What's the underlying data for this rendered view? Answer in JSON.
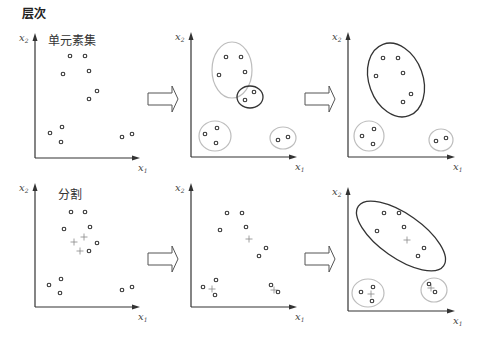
{
  "title": "层次",
  "colors": {
    "axis": "#333333",
    "point": "#333333",
    "ellipse_light": "#bdbdbd",
    "ellipse_dark": "#333333",
    "plus": "#888888",
    "arrow": "#555555"
  },
  "rows": [
    {
      "label": "单元素集",
      "panels": [
        {
          "origin": [
            35,
            158
          ],
          "ytop": 33,
          "xright": 140,
          "points": [
            [
              70,
              56
            ],
            [
              85,
              56
            ],
            [
              63,
              74
            ],
            [
              89,
              71
            ],
            [
              97,
              91
            ],
            [
              89,
              99
            ],
            [
              62,
              127
            ],
            [
              50,
              133
            ],
            [
              61,
              142
            ],
            [
              122,
              137
            ],
            [
              132,
              134
            ]
          ],
          "plus": [],
          "ellipses": []
        },
        {
          "origin": [
            191,
            157
          ],
          "ytop": 32,
          "xright": 297,
          "points": [
            [
              226,
              57
            ],
            [
              241,
              57
            ],
            [
              219,
              75
            ],
            [
              245,
              72
            ],
            [
              254,
              92
            ],
            [
              245,
              100
            ],
            [
              217,
              128
            ],
            [
              205,
              134
            ],
            [
              216,
              143
            ],
            [
              278,
              140
            ],
            [
              288,
              137
            ]
          ],
          "plus": [],
          "ellipses": [
            {
              "cx": 232,
              "cy": 70,
              "rx": 20,
              "ry": 28,
              "rot": 0,
              "tone": "light"
            },
            {
              "cx": 250,
              "cy": 97,
              "rx": 13,
              "ry": 11,
              "rot": 0,
              "tone": "dark"
            },
            {
              "cx": 215,
              "cy": 136,
              "rx": 16,
              "ry": 15,
              "rot": 0,
              "tone": "light"
            },
            {
              "cx": 283,
              "cy": 138,
              "rx": 13,
              "ry": 11,
              "rot": 0,
              "tone": "light"
            }
          ]
        },
        {
          "origin": [
            348,
            157
          ],
          "ytop": 32,
          "xright": 455,
          "points": [
            [
              383,
              58
            ],
            [
              398,
              58
            ],
            [
              376,
              76
            ],
            [
              403,
              73
            ],
            [
              411,
              94
            ],
            [
              403,
              102
            ],
            [
              374,
              129
            ],
            [
              362,
              136
            ],
            [
              373,
              144
            ],
            [
              436,
              141
            ],
            [
              446,
              138
            ]
          ],
          "plus": [],
          "ellipses": [
            {
              "cx": 396,
              "cy": 80,
              "rx": 27,
              "ry": 38,
              "rot": -20,
              "tone": "dark"
            },
            {
              "cx": 369,
              "cy": 136,
              "rx": 15,
              "ry": 15,
              "rot": 0,
              "tone": "light"
            },
            {
              "cx": 441,
              "cy": 140,
              "rx": 12,
              "ry": 11,
              "rot": 0,
              "tone": "light"
            }
          ]
        }
      ]
    },
    {
      "label": "分割",
      "panels": [
        {
          "origin": [
            35,
            307
          ],
          "ytop": 183,
          "xright": 140,
          "points": [
            [
              71,
              212
            ],
            [
              85,
              212
            ],
            [
              64,
              229
            ],
            [
              90,
              227
            ],
            [
              97,
              243
            ],
            [
              89,
              251
            ],
            [
              61,
              279
            ],
            [
              49,
              285
            ],
            [
              60,
              293
            ],
            [
              122,
              290
            ],
            [
              132,
              287
            ]
          ],
          "plus": [
            [
              84,
              237
            ],
            [
              74,
              242
            ],
            [
              80,
              251
            ]
          ],
          "ellipses": []
        },
        {
          "origin": [
            191,
            307
          ],
          "ytop": 183,
          "xright": 297,
          "points": [
            [
              227,
              213
            ],
            [
              242,
              213
            ],
            [
              220,
              230
            ],
            [
              246,
              227
            ],
            [
              266,
              248
            ],
            [
              259,
              256
            ],
            [
              216,
              280
            ],
            [
              203,
              287
            ],
            [
              215,
              295
            ],
            [
              271,
              285
            ],
            [
              278,
              292
            ]
          ],
          "plus": [
            [
              249,
              239
            ],
            [
              212,
              289
            ],
            [
              274,
              290
            ]
          ],
          "ellipses": []
        },
        {
          "origin": [
            348,
            311
          ],
          "ytop": 187,
          "xright": 455,
          "points": [
            [
              384,
              213
            ],
            [
              399,
              213
            ],
            [
              377,
              231
            ],
            [
              404,
              227
            ],
            [
              424,
              248
            ],
            [
              418,
              256
            ],
            [
              373,
              287
            ],
            [
              361,
              292
            ],
            [
              372,
              301
            ],
            [
              429,
              284
            ],
            [
              435,
              292
            ]
          ],
          "plus": [
            [
              407,
              240
            ],
            [
              371,
              294
            ],
            [
              431,
              288
            ]
          ],
          "ellipses": [
            {
              "cx": 401,
              "cy": 236,
              "rx": 52,
              "ry": 22,
              "rot": 35,
              "tone": "dark"
            },
            {
              "cx": 368,
              "cy": 293,
              "rx": 16,
              "ry": 14,
              "rot": 0,
              "tone": "light"
            },
            {
              "cx": 434,
              "cy": 290,
              "rx": 13,
              "ry": 12,
              "rot": 0,
              "tone": "light"
            }
          ]
        }
      ]
    }
  ],
  "arrows": [
    {
      "x": 148,
      "y": 99
    },
    {
      "x": 305,
      "y": 99
    },
    {
      "x": 148,
      "y": 259
    },
    {
      "x": 305,
      "y": 259
    }
  ],
  "axis_labels": {
    "x": "x",
    "x_sub": "1",
    "y": "x",
    "y_sub": "2"
  }
}
